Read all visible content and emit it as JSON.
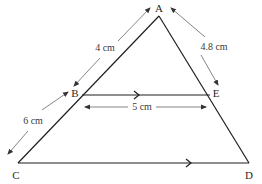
{
  "diagram": {
    "type": "geometry-triangle-parallel-line",
    "colors": {
      "line": "#1f1f1f",
      "dimension": "#555555",
      "text": "#2a2a2a",
      "background": "#ffffff"
    },
    "points": {
      "A": {
        "label": "A",
        "x": 159,
        "y": 16
      },
      "B": {
        "label": "B",
        "x": 82,
        "y": 95
      },
      "E": {
        "label": "E",
        "x": 210,
        "y": 95
      },
      "C": {
        "label": "C",
        "x": 18,
        "y": 163
      },
      "D": {
        "label": "D",
        "x": 249,
        "y": 163
      }
    },
    "segments": [
      {
        "from": "A",
        "to": "C",
        "name": "side-AC"
      },
      {
        "from": "A",
        "to": "D",
        "name": "side-AD"
      },
      {
        "from": "C",
        "to": "D",
        "name": "base-CD",
        "parallel_mark": true
      },
      {
        "from": "B",
        "to": "E",
        "name": "segment-BE",
        "parallel_mark": true
      }
    ],
    "measurements": {
      "AB": "4 cm",
      "BC": "6 cm",
      "AE": "4.8 cm",
      "BE": "5 cm"
    },
    "parallel": "BE ∥ CD"
  }
}
